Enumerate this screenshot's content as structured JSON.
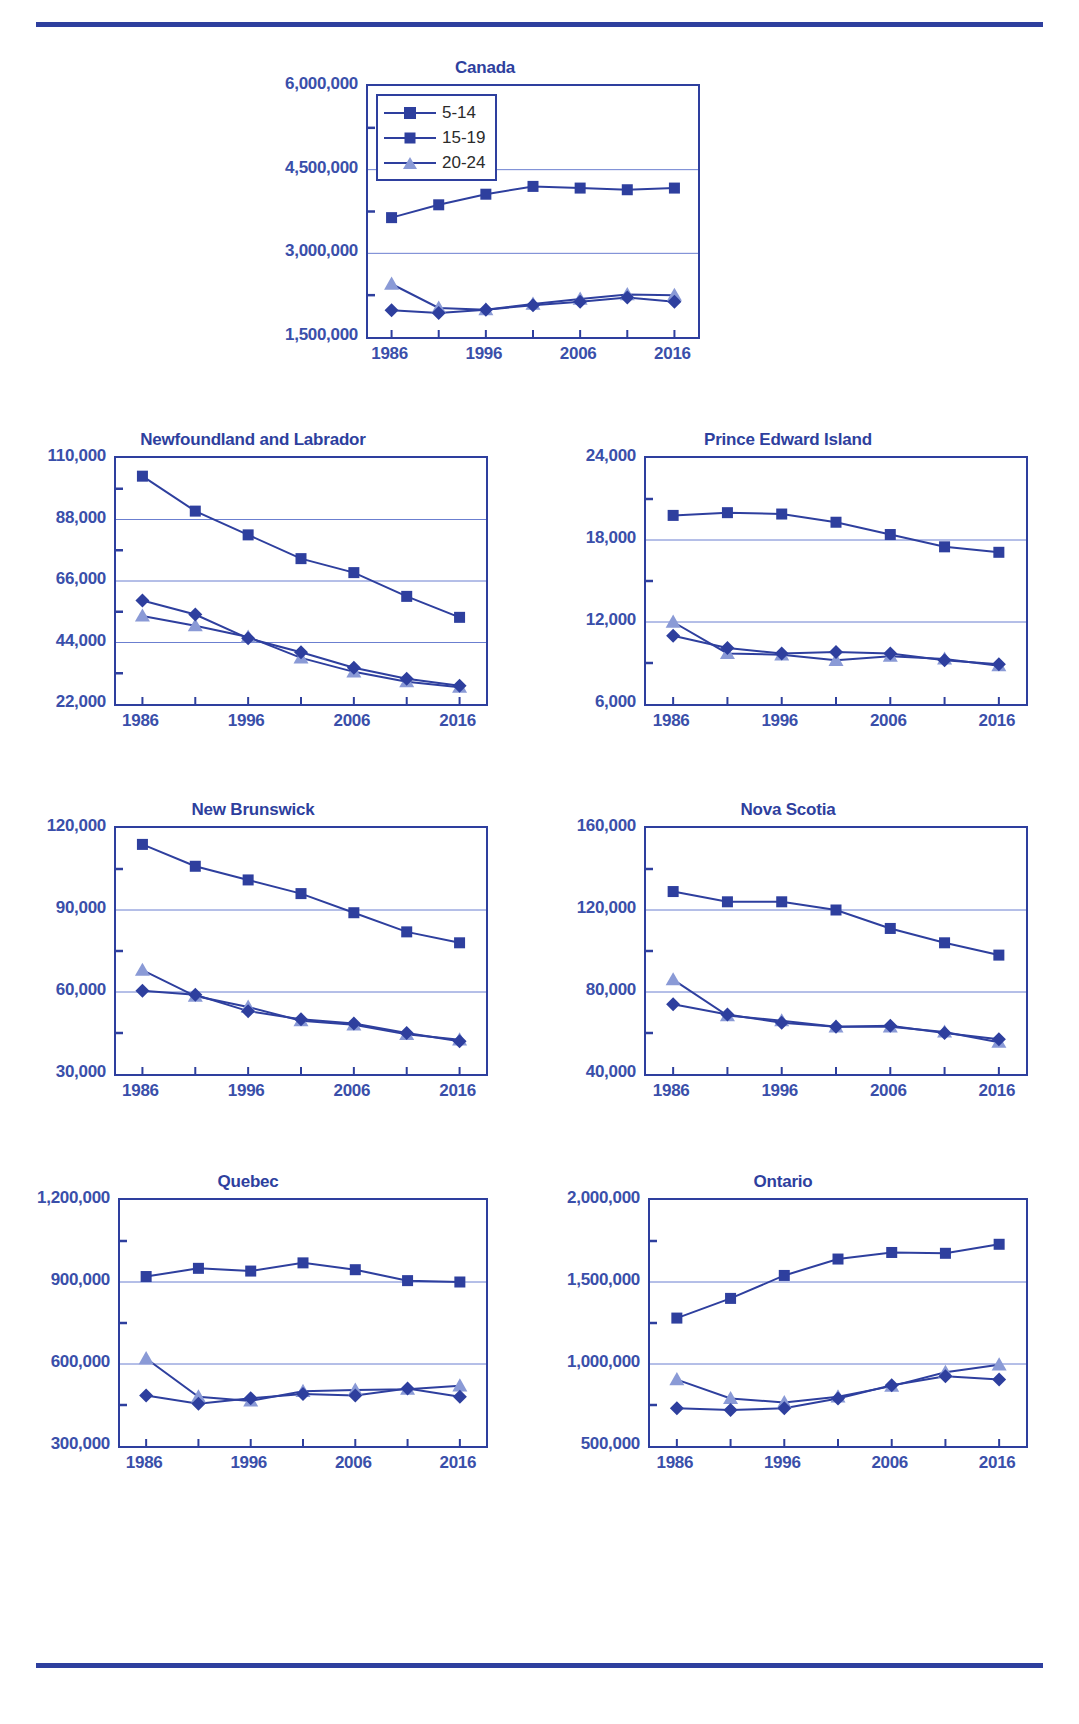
{
  "legend": {
    "items": [
      {
        "label": "5-14",
        "marker": "square",
        "color": "#2e3f9e"
      },
      {
        "label": "15-19",
        "marker": "diamond",
        "color": "#2e3f9e"
      },
      {
        "label": "20-24",
        "marker": "triangle",
        "color": "#8a9ad6"
      }
    ]
  },
  "colors": {
    "primary": "#2e3f9e",
    "secondary": "#8a9ad6",
    "text": "#3a4faa",
    "gridline": "#6b7fd0",
    "rule": "#2e3f9e"
  },
  "chart_data": [
    {
      "type": "line",
      "title": "Canada",
      "xlabel": "",
      "ylabel": "",
      "x": [
        1986,
        1991,
        1996,
        2001,
        2006,
        2011,
        2016
      ],
      "xticklabels": [
        "1986",
        "1996",
        "2006",
        "2016"
      ],
      "xticklabel_values": [
        1986,
        1996,
        2006,
        2016
      ],
      "xlim": [
        1983.5,
        2018.5
      ],
      "ylim": [
        1500000,
        6000000
      ],
      "yticklabels": [
        "1,500,000",
        "3,000,000",
        "4,500,000",
        "6,000,000"
      ],
      "ytickvalues": [
        1500000,
        3000000,
        4500000,
        6000000
      ],
      "gridvalues": [
        3000000,
        4500000
      ],
      "grid": true,
      "legend_position": "top-left",
      "series": [
        {
          "name": "5-14",
          "values": [
            3640000,
            3870000,
            4060000,
            4200000,
            4170000,
            4140000,
            4170000
          ]
        },
        {
          "name": "15-19",
          "values": [
            1980000,
            1930000,
            1990000,
            2070000,
            2130000,
            2210000,
            2130000
          ]
        },
        {
          "name": "20-24",
          "values": [
            2450000,
            2020000,
            1990000,
            2090000,
            2180000,
            2260000,
            2250000
          ]
        }
      ]
    },
    {
      "type": "line",
      "title": "Newfoundland and Labrador",
      "xlabel": "",
      "ylabel": "",
      "x": [
        1986,
        1991,
        1996,
        2001,
        2006,
        2011,
        2016
      ],
      "xticklabels": [
        "1986",
        "1996",
        "2006",
        "2016"
      ],
      "xticklabel_values": [
        1986,
        1996,
        2006,
        2016
      ],
      "xlim": [
        1983.5,
        2018.5
      ],
      "ylim": [
        22000,
        110000
      ],
      "yticklabels": [
        "22,000",
        "44,000",
        "66,000",
        "88,000",
        "110,000"
      ],
      "ytickvalues": [
        22000,
        44000,
        66000,
        88000,
        110000
      ],
      "gridvalues": [
        44000,
        66000,
        88000
      ],
      "grid": true,
      "legend_position": "none",
      "series": [
        {
          "name": "5-14",
          "values": [
            103500,
            91000,
            82500,
            74000,
            69000,
            60500,
            53000
          ]
        },
        {
          "name": "15-19",
          "values": [
            59000,
            54000,
            45500,
            40500,
            35000,
            31000,
            28500
          ]
        },
        {
          "name": "20-24",
          "values": [
            53500,
            50000,
            46000,
            38500,
            33500,
            30000,
            28000
          ]
        }
      ]
    },
    {
      "type": "line",
      "title": "Prince Edward Island",
      "xlabel": "",
      "ylabel": "",
      "x": [
        1986,
        1991,
        1996,
        2001,
        2006,
        2011,
        2016
      ],
      "xticklabels": [
        "1986",
        "1996",
        "2006",
        "2016"
      ],
      "xticklabel_values": [
        1986,
        1996,
        2006,
        2016
      ],
      "xlim": [
        1983.5,
        2018.5
      ],
      "ylim": [
        6000,
        24000
      ],
      "yticklabels": [
        "6,000",
        "12,000",
        "18,000",
        "24,000"
      ],
      "ytickvalues": [
        6000,
        12000,
        18000,
        24000
      ],
      "gridvalues": [
        12000,
        18000
      ],
      "grid": true,
      "legend_position": "none",
      "series": [
        {
          "name": "5-14",
          "values": [
            19800,
            20000,
            19900,
            19300,
            18400,
            17500,
            17100
          ]
        },
        {
          "name": "15-19",
          "values": [
            11000,
            10100,
            9700,
            9800,
            9700,
            9200,
            8900
          ]
        },
        {
          "name": "20-24",
          "values": [
            12000,
            9700,
            9600,
            9200,
            9500,
            9300,
            8800
          ]
        }
      ]
    },
    {
      "type": "line",
      "title": "New Brunswick",
      "xlabel": "",
      "ylabel": "",
      "x": [
        1986,
        1991,
        1996,
        2001,
        2006,
        2011,
        2016
      ],
      "xticklabels": [
        "1986",
        "1996",
        "2006",
        "2016"
      ],
      "xticklabel_values": [
        1986,
        1996,
        2006,
        2016
      ],
      "xlim": [
        1983.5,
        2018.5
      ],
      "ylim": [
        30000,
        120000
      ],
      "yticklabels": [
        "30,000",
        "60,000",
        "90,000",
        "120,000"
      ],
      "ytickvalues": [
        30000,
        60000,
        90000,
        120000
      ],
      "gridvalues": [
        60000,
        90000
      ],
      "grid": true,
      "legend_position": "none",
      "series": [
        {
          "name": "5-14",
          "values": [
            114000,
            106000,
            101000,
            96000,
            89000,
            82000,
            78000
          ]
        },
        {
          "name": "15-19",
          "values": [
            60500,
            59000,
            53000,
            50000,
            48500,
            45000,
            42000
          ]
        },
        {
          "name": "20-24",
          "values": [
            68000,
            58500,
            54500,
            49500,
            48000,
            44500,
            42500
          ]
        }
      ]
    },
    {
      "type": "line",
      "title": "Nova Scotia",
      "xlabel": "",
      "ylabel": "",
      "x": [
        1986,
        1991,
        1996,
        2001,
        2006,
        2011,
        2016
      ],
      "xticklabels": [
        "1986",
        "1996",
        "2006",
        "2016"
      ],
      "xticklabel_values": [
        1986,
        1996,
        2006,
        2016
      ],
      "xlim": [
        1983.5,
        2018.5
      ],
      "ylim": [
        40000,
        160000
      ],
      "yticklabels": [
        "40,000",
        "80,000",
        "120,000",
        "160,000"
      ],
      "ytickvalues": [
        40000,
        80000,
        120000,
        160000
      ],
      "gridvalues": [
        80000,
        120000
      ],
      "grid": true,
      "legend_position": "none",
      "series": [
        {
          "name": "5-14",
          "values": [
            129000,
            124000,
            124000,
            120000,
            111000,
            104000,
            98000
          ]
        },
        {
          "name": "15-19",
          "values": [
            74000,
            69000,
            65000,
            63000,
            63500,
            60000,
            57000
          ]
        },
        {
          "name": "20-24",
          "values": [
            86000,
            68500,
            66000,
            63000,
            63000,
            60500,
            55500
          ]
        }
      ]
    },
    {
      "type": "line",
      "title": "Quebec",
      "xlabel": "",
      "ylabel": "",
      "x": [
        1986,
        1991,
        1996,
        2001,
        2006,
        2011,
        2016
      ],
      "xticklabels": [
        "1986",
        "1996",
        "2006",
        "2016"
      ],
      "xticklabel_values": [
        1986,
        1996,
        2006,
        2016
      ],
      "xlim": [
        1983.5,
        2018.5
      ],
      "ylim": [
        300000,
        1200000
      ],
      "yticklabels": [
        "300,000",
        "600,000",
        "900,000",
        "1,200,000"
      ],
      "ytickvalues": [
        300000,
        600000,
        900000,
        1200000
      ],
      "gridvalues": [
        600000,
        900000
      ],
      "grid": true,
      "legend_position": "none",
      "series": [
        {
          "name": "5-14",
          "values": [
            920000,
            950000,
            940000,
            970000,
            945000,
            905000,
            900000
          ]
        },
        {
          "name": "15-19",
          "values": [
            485000,
            455000,
            475000,
            490000,
            485000,
            510000,
            480000
          ]
        },
        {
          "name": "20-24",
          "values": [
            620000,
            480000,
            465000,
            500000,
            505000,
            508000,
            520000
          ]
        }
      ]
    },
    {
      "type": "line",
      "title": "Ontario",
      "xlabel": "",
      "ylabel": "",
      "x": [
        1986,
        1991,
        1996,
        2001,
        2006,
        2011,
        2016
      ],
      "xticklabels": [
        "1986",
        "1996",
        "2006",
        "2016"
      ],
      "xticklabel_values": [
        1986,
        1996,
        2006,
        2016
      ],
      "xlim": [
        1983.5,
        2018.5
      ],
      "ylim": [
        500000,
        2000000
      ],
      "yticklabels": [
        "500,000",
        "1,000,000",
        "1,500,000",
        "2,000,000"
      ],
      "ytickvalues": [
        500000,
        1000000,
        1500000,
        2000000
      ],
      "gridvalues": [
        1000000,
        1500000
      ],
      "grid": true,
      "legend_position": "none",
      "series": [
        {
          "name": "5-14",
          "values": [
            1280000,
            1400000,
            1540000,
            1640000,
            1680000,
            1675000,
            1730000
          ]
        },
        {
          "name": "15-19",
          "values": [
            730000,
            720000,
            730000,
            790000,
            870000,
            925000,
            905000
          ]
        },
        {
          "name": "20-24",
          "values": [
            905000,
            790000,
            765000,
            800000,
            865000,
            950000,
            995000
          ]
        }
      ]
    }
  ]
}
